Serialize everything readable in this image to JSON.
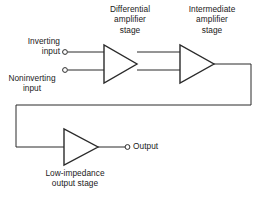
{
  "diagram": {
    "type": "block-diagram",
    "background_color": "#ffffff",
    "line_color": "#2b2b2b",
    "text_color": "#1a1a1a",
    "stages": [
      {
        "id": "differential-amplifier",
        "label": "Differential\namplifier\nstage",
        "shape": "triangle",
        "inputs": 2,
        "outputs": 1
      },
      {
        "id": "intermediate-amplifier",
        "label": "Intermediate\namplifier\nstage",
        "shape": "triangle",
        "inputs": 2,
        "outputs": 1
      },
      {
        "id": "low-impedance-output",
        "label": "Low-impedance\noutput stage",
        "shape": "triangle",
        "inputs": 1,
        "outputs": 1
      }
    ],
    "terminals": [
      {
        "id": "inverting-input",
        "label": "Inverting\ninput",
        "type": "input",
        "marker": "open-circle"
      },
      {
        "id": "noninverting-input",
        "label": "Noninverting\ninput",
        "type": "input",
        "marker": "open-circle"
      },
      {
        "id": "output",
        "label": "Output",
        "type": "output",
        "marker": "open-circle"
      }
    ],
    "connections": [
      {
        "from": "inverting-input",
        "to": "differential-amplifier"
      },
      {
        "from": "noninverting-input",
        "to": "differential-amplifier"
      },
      {
        "from": "differential-amplifier",
        "to": "intermediate-amplifier"
      },
      {
        "from": "intermediate-amplifier",
        "to": "low-impedance-output",
        "routing": "right-down-left-down-right"
      },
      {
        "from": "low-impedance-output",
        "to": "output"
      }
    ]
  }
}
